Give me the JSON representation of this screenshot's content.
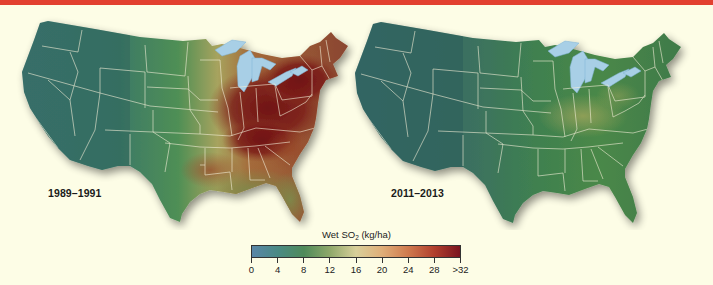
{
  "header": {
    "accent_color": "#e2402f"
  },
  "maps": [
    {
      "id": "left",
      "period_label": "1989–1991"
    },
    {
      "id": "right",
      "period_label": "2011–2013"
    }
  ],
  "legend": {
    "title_prefix": "Wet SO",
    "title_subscript": "2",
    "title_suffix": " (kg/ha)",
    "ticks": [
      "0",
      "4",
      "8",
      "12",
      "16",
      "20",
      "24",
      "28",
      ">32"
    ],
    "colors": [
      "#5a86a8",
      "#4a8a84",
      "#4f8a5a",
      "#8fa86a",
      "#d8cf9a",
      "#dfae78",
      "#cf7a4e",
      "#b2402e",
      "#7a1420"
    ]
  },
  "chart_data": {
    "type": "heatmap",
    "title": "Wet SO2 (kg/ha)",
    "panels": [
      {
        "label": "1989–1991",
        "description": "Contiguous US wet SO2 deposition; high values (>28 to >32 kg/ha) concentrated in Ohio Valley, Pennsylvania, New York, Northeast; moderate values (12–24) in Midwest and Southeast; low values (0–8) in West",
        "regions": [
          {
            "region": "Ohio Valley / Pennsylvania / Northeast",
            "value_range": ">28"
          },
          {
            "region": "Southeast / Lower Mississippi",
            "value_range": "16–24"
          },
          {
            "region": "Great Plains",
            "value_range": "8–12"
          },
          {
            "region": "West",
            "value_range": "0–8"
          }
        ]
      },
      {
        "label": "2011–2013",
        "description": "Deposition greatly reduced; mostly low values across the country, slight elevation (12–16) in Ohio Valley",
        "regions": [
          {
            "region": "Ohio Valley",
            "value_range": "12–16"
          },
          {
            "region": "East / Southeast",
            "value_range": "8–12"
          },
          {
            "region": "Great Plains",
            "value_range": "4–10"
          },
          {
            "region": "West",
            "value_range": "0–6"
          }
        ]
      }
    ],
    "colorbar": {
      "label": "Wet SO2 (kg/ha)",
      "ticks": [
        0,
        4,
        8,
        12,
        16,
        20,
        24,
        28,
        ">32"
      ],
      "range": [
        0,
        32
      ]
    }
  }
}
